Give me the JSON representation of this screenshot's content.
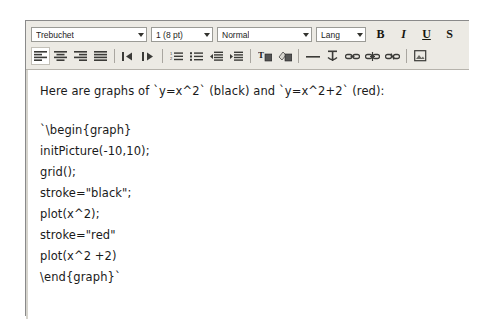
{
  "window": {
    "name": "rich-text-editor"
  },
  "toolbar": {
    "row1": {
      "font_family": {
        "value": "Trebuchet",
        "name": "font-family-select"
      },
      "font_size": {
        "value": "1 (8 pt)",
        "name": "font-size-select"
      },
      "paragraph_style": {
        "value": "Normal",
        "name": "paragraph-style-select"
      },
      "language": {
        "value": "Lang",
        "name": "language-select"
      },
      "bold": "B",
      "italic": "I",
      "underline": "U",
      "strikethrough": "S"
    },
    "row2": {
      "icons": [
        "align-left-icon",
        "align-center-icon",
        "align-right-icon",
        "align-justify-icon",
        "direction-ltr-icon",
        "direction-rtl-icon",
        "ordered-list-icon",
        "unordered-list-icon",
        "outdent-icon",
        "indent-icon",
        "text-color-icon",
        "background-color-icon",
        "horizontal-rule-icon",
        "anchor-icon",
        "insert-link-icon",
        "edit-link-icon",
        "unlink-icon",
        "insert-image-icon"
      ]
    }
  },
  "document": {
    "lines": [
      "Here are graphs of `y=x^2` (black) and `y=x^2+2` (red):",
      "",
      "`\\begin{graph}",
      "initPicture(-10,10);",
      "grid();",
      "stroke=\"black\";",
      "plot(x^2);",
      "stroke=\"red\"",
      "plot(x^2 +2)",
      "\\end{graph}`"
    ]
  },
  "colors": {
    "toolbar_bg": "#eceae4",
    "window_border": "#8a8a8a",
    "text": "#1a1a1a",
    "page_bg": "#ffffff"
  }
}
